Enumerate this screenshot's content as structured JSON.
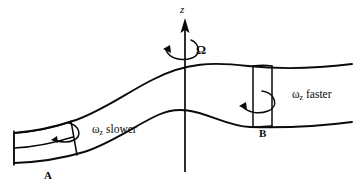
{
  "figure": {
    "type": "diagram",
    "background_color": "#ffffff",
    "line_color": "#0a0a0a"
  },
  "axis": {
    "label": "z",
    "rotation_symbol": "Ω",
    "rotation_name": "Omega",
    "direction": "up"
  },
  "elements": [
    {
      "id": "A",
      "label": "A",
      "annotation_symbol": "ω",
      "annotation_subscript": "z",
      "annotation_text": "slower",
      "annotation_full": "ωz slower",
      "shape": "short-wide-column",
      "position": "left"
    },
    {
      "id": "B",
      "label": "B",
      "annotation_symbol": "ω",
      "annotation_subscript": "z",
      "annotation_text": "faster",
      "annotation_full": "ωz faster",
      "shape": "tall-narrow-column",
      "position": "right"
    }
  ],
  "labels": {
    "axis_z": "z",
    "omega_capital": "Ω",
    "point_a": "A",
    "point_b": "B",
    "omega_lower": "ω",
    "sub_z": "z",
    "slower": "slower",
    "faster": "faster"
  }
}
